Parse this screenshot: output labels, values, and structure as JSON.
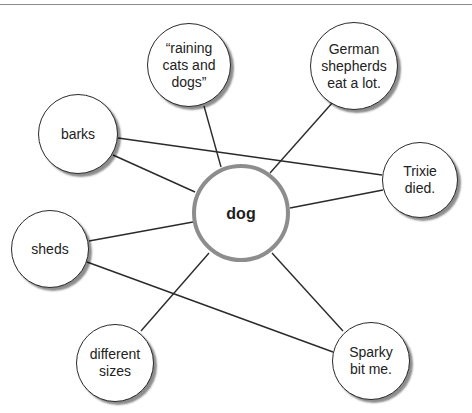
{
  "diagram": {
    "type": "concept-web",
    "center": {
      "id": "dog",
      "label": "dog",
      "cx": 241,
      "cy": 213,
      "r": 49
    },
    "nodes": [
      {
        "id": "raining",
        "label": "“raining\ncats and\ndogs”",
        "cx": 189,
        "cy": 65,
        "r": 42
      },
      {
        "id": "german",
        "label": "German\nshepherds\neat a lot.",
        "cx": 354,
        "cy": 66,
        "r": 44
      },
      {
        "id": "barks",
        "label": "barks",
        "cx": 78,
        "cy": 134,
        "r": 40
      },
      {
        "id": "trixie",
        "label": "Trixie\ndied.",
        "cx": 420,
        "cy": 180,
        "r": 38
      },
      {
        "id": "sheds",
        "label": "sheds",
        "cx": 50,
        "cy": 249,
        "r": 39
      },
      {
        "id": "different",
        "label": "different\nsizes",
        "cx": 115,
        "cy": 363,
        "r": 39
      },
      {
        "id": "sparky",
        "label": "Sparky\nbit me.",
        "cx": 371,
        "cy": 361,
        "r": 39
      }
    ],
    "edges": [
      {
        "from": "barks",
        "to": "trixie",
        "x1": 118,
        "y1": 138,
        "x2": 382,
        "y2": 175
      },
      {
        "from": "barks",
        "to": "dog",
        "x1": 113,
        "y1": 155,
        "x2": 195,
        "y2": 192
      },
      {
        "from": "raining",
        "to": "dog",
        "x1": 204,
        "y1": 106,
        "x2": 221,
        "y2": 167
      },
      {
        "from": "german",
        "to": "dog",
        "x1": 333,
        "y1": 102,
        "x2": 270,
        "y2": 173
      },
      {
        "from": "trixie",
        "to": "dog",
        "x1": 383,
        "y1": 190,
        "x2": 290,
        "y2": 208
      },
      {
        "from": "sheds",
        "to": "dog",
        "x1": 89,
        "y1": 241,
        "x2": 193,
        "y2": 222
      },
      {
        "from": "sheds",
        "to": "sparky",
        "x1": 87,
        "y1": 262,
        "x2": 333,
        "y2": 352
      },
      {
        "from": "different",
        "to": "dog",
        "x1": 141,
        "y1": 331,
        "x2": 209,
        "y2": 253
      },
      {
        "from": "dog",
        "to": "sparky",
        "x1": 272,
        "y1": 253,
        "x2": 343,
        "y2": 331
      }
    ],
    "colors": {
      "line": "#2a2a2a",
      "center_border": "#8d8d8d",
      "node_border": "#2a2a2a"
    }
  }
}
